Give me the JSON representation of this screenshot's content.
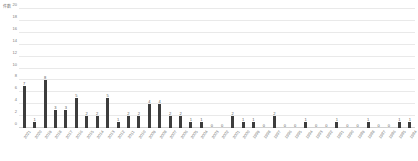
{
  "chart_data": {
    "type": "bar",
    "title": "",
    "subtitle": "",
    "unit_caption": "件数",
    "xlabel": "",
    "ylabel": "",
    "ylim": [
      0,
      20
    ],
    "ytick_step": 2,
    "yticks": [
      20,
      18,
      16,
      14,
      12,
      10,
      8,
      6,
      4,
      2,
      0
    ],
    "grid": true,
    "legend": "none",
    "bar_color": "#3d3d3d",
    "grid_color": "#e9e9e9",
    "label_color": "#6e6e6e",
    "show_value_labels": true,
    "categories": [
      "2021",
      "2020",
      "2019",
      "2018",
      "2017",
      "2016",
      "2015",
      "2014",
      "2013",
      "2012",
      "2011",
      "2010",
      "2009",
      "2008",
      "2007",
      "2006",
      "2005",
      "2004",
      "2003",
      "2002",
      "2001",
      "2000",
      "1999",
      "1998",
      "1997",
      "1996",
      "1995",
      "1994",
      "1993",
      "1992",
      "1991",
      "1990",
      "1989",
      "1988",
      "1987",
      "1986",
      "1985",
      "1984"
    ],
    "values": [
      7,
      1,
      8,
      3,
      3,
      5,
      2,
      2,
      5,
      1,
      2,
      2,
      4,
      4,
      2,
      2,
      1,
      1,
      0,
      0,
      2,
      1,
      1,
      0,
      2,
      0,
      0,
      1,
      0,
      0,
      1,
      0,
      0,
      1,
      0,
      0,
      1,
      1
    ]
  }
}
